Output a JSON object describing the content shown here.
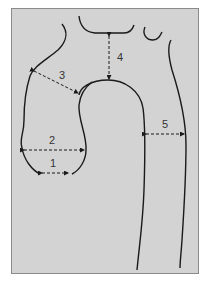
{
  "diagram": {
    "background_color": "#d3d3d3",
    "line_color": "#1a1a1a",
    "measurements": [
      {
        "id": 1,
        "label": "1"
      },
      {
        "id": 2,
        "label": "2"
      },
      {
        "id": 3,
        "label": "3"
      },
      {
        "id": 4,
        "label": "4"
      },
      {
        "id": 5,
        "label": "5"
      }
    ]
  }
}
